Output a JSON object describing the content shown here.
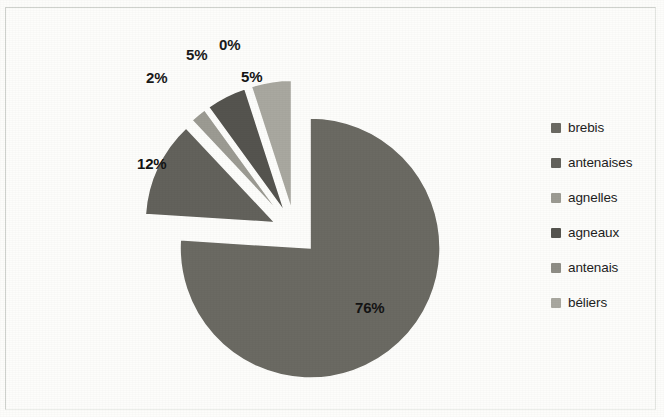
{
  "chart_data": {
    "type": "pie",
    "title": "",
    "subtitle": "",
    "xlabel": "",
    "ylabel": "",
    "exploded": true,
    "legend_position": "right",
    "grid": false,
    "categories": [
      "brebis",
      "antenaises",
      "agnelles",
      "agneaux",
      "antenais",
      "béliers"
    ],
    "values": [
      76,
      12,
      2,
      5,
      0,
      5
    ],
    "data_labels": [
      "76%",
      "12%",
      "2%",
      "5%",
      "0%",
      "5%"
    ],
    "slice_colors": [
      "#6b6a63",
      "#63625c",
      "#9c9b93",
      "#55544f",
      "#8f8e86",
      "#a9a8a0"
    ],
    "slices": [
      {
        "label": "brebis",
        "value": 76,
        "display": "76%",
        "color": "#6b6a63"
      },
      {
        "label": "antenaises",
        "value": 12,
        "display": "12%",
        "color": "#63625c"
      },
      {
        "label": "agnelles",
        "value": 2,
        "display": "2%",
        "color": "#9c9b93"
      },
      {
        "label": "agneaux",
        "value": 5,
        "display": "5%",
        "color": "#55544f"
      },
      {
        "label": "antenais",
        "value": 0,
        "display": "0%",
        "color": "#8f8e86"
      },
      {
        "label": "béliers",
        "value": 5,
        "display": "5%",
        "color": "#a9a8a0"
      }
    ]
  },
  "legend": {
    "items": [
      {
        "label": "brebis",
        "color": "#6b6a63"
      },
      {
        "label": "antenaises",
        "color": "#63625c"
      },
      {
        "label": "agnelles",
        "color": "#9c9b93"
      },
      {
        "label": "agneaux",
        "color": "#55544f"
      },
      {
        "label": "antenais",
        "color": "#8f8e86"
      },
      {
        "label": "béliers",
        "color": "#a9a8a0"
      }
    ]
  },
  "labels": {
    "brebis": "76%",
    "antenaises": "12%",
    "agnelles": "2%",
    "agneaux": "5%",
    "antenais": "0%",
    "beliers": "5%"
  },
  "colors": {
    "background": "#fdfdfb",
    "border": "#cfd2cd",
    "text": "#1a1a1a"
  }
}
